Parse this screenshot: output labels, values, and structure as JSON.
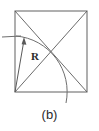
{
  "figure": {
    "caption": "(b)",
    "labels": {
      "radius": "R"
    },
    "colors": {
      "background": "#ffffff",
      "stroke": "#6e6e6e",
      "stroke_dark": "#5a5a5a",
      "text": "#2b2b2b"
    },
    "geometry": {
      "square": {
        "left": 15,
        "top": 11,
        "right": 87,
        "bottom": 92,
        "width": 72,
        "height": 81
      },
      "diagonals": [
        {
          "name": "diagonal-tl-br",
          "x1": 15,
          "y1": 11,
          "x2": 87,
          "y2": 92
        },
        {
          "name": "diagonal-bl-tr",
          "x1": 15,
          "y1": 92,
          "x2": 87,
          "y2": 11
        }
      ],
      "arc": {
        "center_x": 15,
        "center_y": 92,
        "radius": 56,
        "start_x": 16,
        "start_y": 36,
        "end_x": 66,
        "end_y": 103
      },
      "radius_arrow": {
        "from_x": 15,
        "from_y": 92,
        "to_x": 24,
        "to_y": 38
      },
      "tangent_line": {
        "x1": 2,
        "y1": 37,
        "x2": 21,
        "y2": 36
      },
      "radius_label_position": {
        "x": 31,
        "y": 60
      }
    }
  }
}
